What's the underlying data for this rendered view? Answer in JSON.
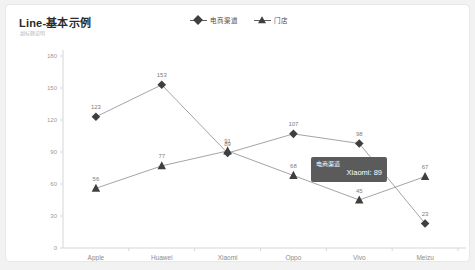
{
  "card": {
    "title": "Line-基本示例",
    "subtitle": "副标题说明"
  },
  "legend": {
    "position": "top-center",
    "items": [
      {
        "label": "电商渠道",
        "marker": "diamond",
        "color": "#3f3f3f"
      },
      {
        "label": "门店",
        "marker": "triangle",
        "color": "#3f3f3f"
      }
    ]
  },
  "tooltip": {
    "series": "电商渠道",
    "value_text": "Xiaomi: 89",
    "background": "#5b5b5b"
  },
  "chart_data": {
    "type": "line",
    "title": "Line-基本示例",
    "xlabel": "",
    "ylabel": "",
    "categories": [
      "Apple",
      "Huawei",
      "Xiaomi",
      "Oppo",
      "Vivo",
      "Meizu"
    ],
    "yticks": [
      0,
      30,
      60,
      90,
      120,
      150,
      180
    ],
    "ylim": [
      0,
      180
    ],
    "grid": false,
    "legend_position": "top-center",
    "series": [
      {
        "name": "电商渠道",
        "marker": "diamond",
        "color": "#3f3f3f",
        "values": [
          123,
          153,
          89,
          107,
          98,
          23
        ]
      },
      {
        "name": "门店",
        "marker": "triangle",
        "color": "#3f3f3f",
        "values": [
          56,
          77,
          91,
          68,
          45,
          67
        ]
      }
    ]
  }
}
